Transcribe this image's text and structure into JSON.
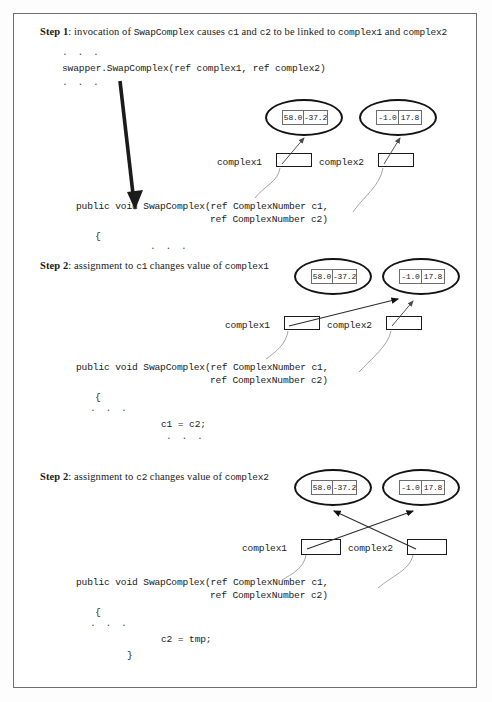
{
  "figure": {
    "title_note": "SwapComplex reference-parameter swap illustration",
    "sections": [
      {
        "id": "step1",
        "heading": {
          "step": "Step 1",
          "text_before": ": invocation of ",
          "mono1": "SwapComplex",
          "text_mid1": " causes ",
          "mono2": "c1",
          "text_mid2": " and ",
          "mono3": "c2",
          "text_mid3": " to be linked to ",
          "mono4": "complex1",
          "text_mid4": " and ",
          "mono5": "complex2"
        },
        "dots_top": ". . .",
        "call_line": "swapper.SwapComplex(ref complex1, ref complex2)",
        "dots_mid": ". . .",
        "signature_line1": "public void SwapComplex(ref ComplexNumber c1,",
        "signature_line2": "ref ComplexNumber c2)",
        "brace_open": "{",
        "dots_body": ". . .",
        "var1_label": "complex1",
        "var2_label": "complex2",
        "object1": {
          "re": "58.0",
          "im": "-37.2"
        },
        "object2": {
          "re": "-1.0",
          "im": "17.8"
        }
      },
      {
        "id": "step2a",
        "heading": {
          "step": "Step 2",
          "text_before": ": assignment to ",
          "mono1": "c1",
          "text_mid1": " changes value of ",
          "mono2": "complex1"
        },
        "signature_line1": "public void SwapComplex(ref ComplexNumber c1,",
        "signature_line2": "ref ComplexNumber c2)",
        "brace_open": "{",
        "dots_body": ". . .",
        "assignment": "c1 = c2;",
        "dots_after": ". . .",
        "var1_label": "complex1",
        "var2_label": "complex2",
        "object1": {
          "re": "58.0",
          "im": "-37.2"
        },
        "object2": {
          "re": "-1.0",
          "im": "17.8"
        }
      },
      {
        "id": "step2b",
        "heading": {
          "step": "Step 2",
          "text_before": ": assignment to ",
          "mono1": "c2",
          "text_mid1": " changes value of ",
          "mono2": "complex2"
        },
        "signature_line1": "public void SwapComplex(ref ComplexNumber c1,",
        "signature_line2": "ref ComplexNumber c2)",
        "brace_open": "{",
        "dots_body": ". . .",
        "assignment": "c2 = tmp;",
        "brace_close": "}",
        "var1_label": "complex1",
        "var2_label": "complex2",
        "object1": {
          "re": "58.0",
          "im": "-37.2"
        },
        "object2": {
          "re": "-1.0",
          "im": "17.8"
        }
      }
    ],
    "colors": {
      "frame": "#6f6f6f",
      "ink": "#1a1a1a",
      "thick_arrow": "#1b1b1b",
      "thin_line": "#8a8a8a"
    }
  }
}
